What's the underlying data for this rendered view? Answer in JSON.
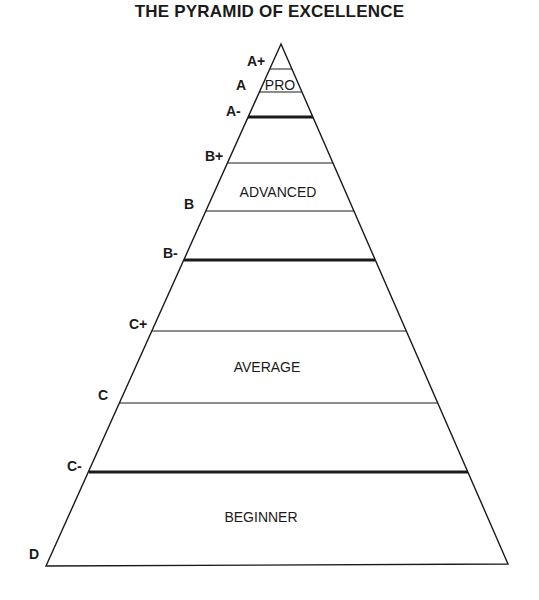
{
  "title": "THE PYRAMID OF EXCELLENCE",
  "colors": {
    "ink": "#1a1a1a",
    "background": "#ffffff"
  },
  "pyramid": {
    "apex": [
      281,
      44
    ],
    "base_left": [
      46,
      566
    ],
    "base_right": [
      508,
      564
    ]
  },
  "grades": [
    {
      "label": "A+",
      "line": "thin"
    },
    {
      "label": "A",
      "line": "thin"
    },
    {
      "label": "A-",
      "line": "thick"
    },
    {
      "label": "B+",
      "line": "thin"
    },
    {
      "label": "B",
      "line": "thin"
    },
    {
      "label": "B-",
      "line": "thick"
    },
    {
      "label": "C+",
      "line": "thin"
    },
    {
      "label": "C",
      "line": "thin"
    },
    {
      "label": "C-",
      "line": "thick"
    },
    {
      "label": "D",
      "line": "base"
    }
  ],
  "tiers": [
    {
      "label": "PRO"
    },
    {
      "label": "ADVANCED"
    },
    {
      "label": "AVERAGE"
    },
    {
      "label": "BEGINNER"
    }
  ]
}
